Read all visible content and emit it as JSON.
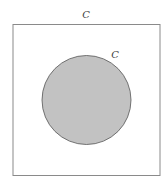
{
  "diagram": {
    "type": "venn",
    "universe": {
      "label": "C",
      "stroke": "#8a8a8a"
    },
    "set": {
      "label": "C",
      "fill": "#c2c2c2",
      "stroke": "#555555"
    }
  }
}
